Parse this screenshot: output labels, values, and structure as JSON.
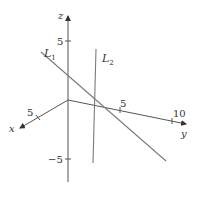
{
  "diagram": {
    "title": "",
    "type": "3d-coordinate-axes-with-lines",
    "colors": {
      "axis": "#444444",
      "line": "#7a7a7a",
      "text": "#333333",
      "background": "#ffffff"
    },
    "axes": {
      "x": {
        "label": "x",
        "ticks": [
          {
            "value": "5"
          }
        ]
      },
      "y": {
        "label": "y",
        "ticks": [
          {
            "value": "5"
          },
          {
            "value": "10"
          }
        ]
      },
      "z": {
        "label": "z",
        "ticks": [
          {
            "value": "5"
          },
          {
            "value": "−5"
          }
        ]
      }
    },
    "lines": [
      {
        "id": "L1",
        "label": "L",
        "subscript": "1"
      },
      {
        "id": "L2",
        "label": "L",
        "subscript": "2"
      }
    ]
  }
}
